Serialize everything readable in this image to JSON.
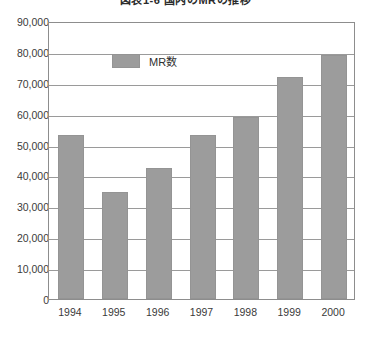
{
  "chart_data": {
    "type": "bar",
    "title": "図表1-6  国内のMRの推移",
    "xlabel": "",
    "ylabel": "",
    "categories": [
      "1994",
      "1995",
      "1996",
      "1997",
      "1998",
      "1999",
      "2000"
    ],
    "values": [
      53000,
      34500,
      42500,
      53000,
      59000,
      72000,
      79000
    ],
    "series": [
      {
        "name": "MR数",
        "values": [
          53000,
          34500,
          42500,
          53000,
          59000,
          72000,
          79000
        ],
        "color": "#9c9c9c"
      }
    ],
    "ylim": [
      0,
      90000
    ],
    "ytick_labels": [
      "0",
      "10,000",
      "20,000",
      "30,000",
      "40,000",
      "50,000",
      "60,000",
      "70,000",
      "80,000",
      "90,000"
    ],
    "ytick_values": [
      0,
      10000,
      20000,
      30000,
      40000,
      50000,
      60000,
      70000,
      80000,
      90000
    ],
    "grid": true,
    "legend_position": "inside-top-left",
    "legend_entries": [
      "MR数"
    ]
  },
  "colors": {
    "bar": "#9c9c9c",
    "bar_border": "#949494",
    "gridline": "#9a9a9a",
    "frame": "#8d8d8d",
    "text": "#3a3a3a",
    "background": "#ffffff"
  }
}
